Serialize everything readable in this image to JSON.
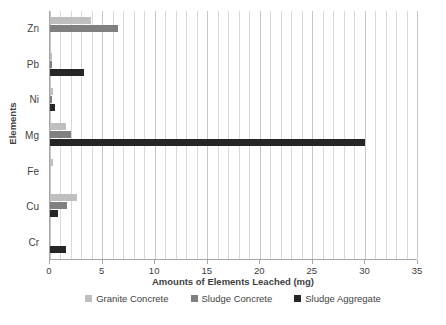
{
  "chart_data": {
    "type": "bar",
    "orientation": "horizontal",
    "title": "",
    "xlabel": "Amounts of Elements Leached (mg)",
    "ylabel": "Elements",
    "categories": [
      "Zn",
      "Pb",
      "Ni",
      "Mg",
      "Fe",
      "Cu",
      "Cr"
    ],
    "xlim": [
      0,
      35
    ],
    "xticks": [
      0,
      5,
      10,
      15,
      20,
      25,
      30,
      35
    ],
    "xtick_labels": [
      "0",
      "5",
      "10",
      "15",
      "20",
      "25",
      "30",
      "35"
    ],
    "minor_gridline_step": 1,
    "grid": true,
    "legend_position": "bottom",
    "series": [
      {
        "name": "Granite Concrete",
        "color": "#bfbfbf",
        "values": [
          3.9,
          0.2,
          0.3,
          1.5,
          0.3,
          2.6,
          0.0
        ]
      },
      {
        "name": "Sludge Concrete",
        "color": "#808080",
        "values": [
          6.5,
          0.2,
          0.2,
          2.0,
          0.0,
          1.6,
          0.0
        ]
      },
      {
        "name": "Sludge Aggregate",
        "color": "#262626",
        "values": [
          0.0,
          3.2,
          0.5,
          30.0,
          0.0,
          0.8,
          1.5
        ]
      }
    ]
  },
  "axis": {
    "y_title": "Elements",
    "x_title": "Amounts of Elements Leached (mg)"
  }
}
